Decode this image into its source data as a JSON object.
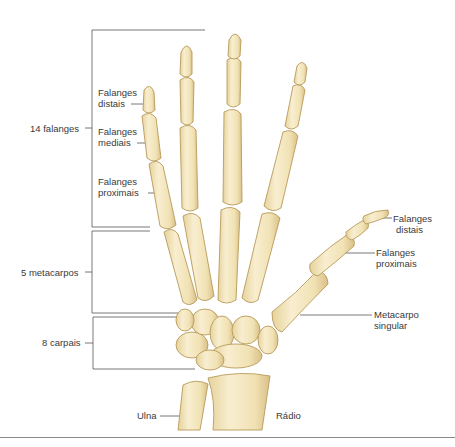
{
  "figure": {
    "colors": {
      "bone_fill": "#f3e6bd",
      "bone_shade": "#dcc58c",
      "bone_outline": "#b89a5a",
      "leader_line": "#555555",
      "text": "#3a3a3a"
    }
  },
  "groups": [
    {
      "label": "14 falanges"
    },
    {
      "label": "5 metacarpos"
    },
    {
      "label": "8 carpais"
    }
  ],
  "left_labels": {
    "distais": {
      "line1": "Falanges",
      "line2": "distais"
    },
    "mediais": {
      "line1": "Falanges",
      "line2": "mediais"
    },
    "proximais": {
      "line1": "Falanges",
      "line2": "proximais"
    }
  },
  "thumb_labels": {
    "distais": {
      "line1": "Falanges",
      "line2": "distais"
    },
    "proximais": {
      "line1": "Falanges",
      "line2": "proximais"
    },
    "metacarpo": {
      "line1": "Metacarpo",
      "line2": "singular"
    }
  },
  "forearm_labels": {
    "ulna": "Ulna",
    "radio": "Rádio"
  }
}
